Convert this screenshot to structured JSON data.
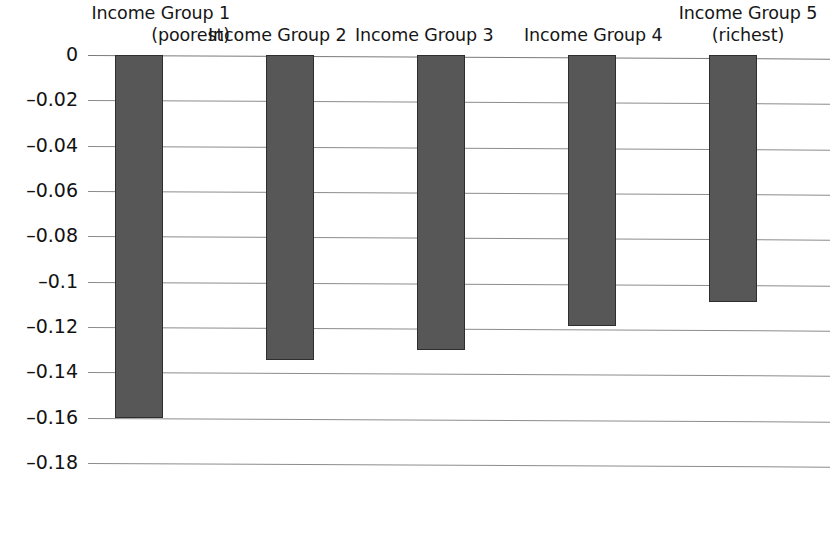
{
  "chart_data": {
    "type": "bar",
    "title": "",
    "subtitle": "",
    "xlabel": "",
    "ylabel": "",
    "orientation": "vertical",
    "grid": true,
    "legend": false,
    "categories": [
      "Income Group 1 (poorest)",
      "Income Group 2",
      "Income Group 3",
      "Income Group 4",
      "Income Group 5 (richest)"
    ],
    "values": [
      -0.16,
      -0.1345,
      -0.13,
      -0.1195,
      -0.109
    ],
    "ylim": [
      -0.18,
      0
    ],
    "yticks": [
      0,
      -0.02,
      -0.04,
      -0.06,
      -0.08,
      -0.1,
      -0.12,
      -0.14,
      -0.16,
      -0.18
    ],
    "ytick_labels": [
      "0",
      "–0.02",
      "–0.04",
      "–0.06",
      "–0.08",
      "–0.1",
      "–0.12",
      "–0.14",
      "–0.16",
      "–0.18"
    ],
    "bar_color": "#575757",
    "bar_border_color": "#2e2e2e",
    "gridline_color": "#8c8c8c"
  },
  "categories_display": [
    {
      "line1": "Income Group 1",
      "line2": "(poorest)"
    },
    {
      "line1": "Income Group 2",
      "line2": ""
    },
    {
      "line1": "Income Group 3",
      "line2": ""
    },
    {
      "line1": "Income Group 4",
      "line2": ""
    },
    {
      "line1": "Income Group 5",
      "line2": "(richest)"
    }
  ]
}
